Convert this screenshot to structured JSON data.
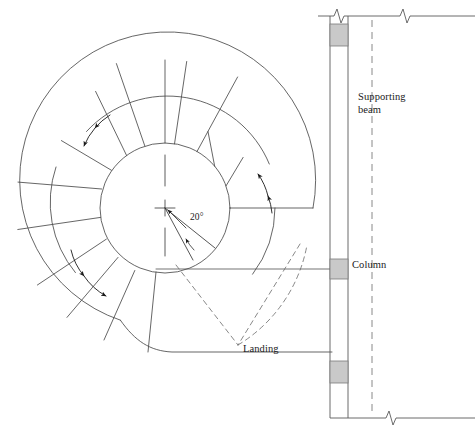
{
  "drawing": {
    "title": "Spiral staircase plan",
    "type": "architectural-plan",
    "canvas": {
      "width": 475,
      "height": 436
    },
    "colors": {
      "line": "#4a4a4a",
      "line_dark": "#2b2b2b",
      "column_fill": "#c9c9c9",
      "column_stroke": "#7a7a7a",
      "text": "#1a1a1a",
      "background": "#ffffff"
    },
    "geometry": {
      "center": {
        "x": 165,
        "y": 208
      },
      "inner_radius": 65,
      "outer_radius": 148,
      "mid_radius": 110,
      "tread_angle_deg": 20,
      "tread_count": 16
    },
    "labels": {
      "supporting_beam": "Supporting\nbeam",
      "column": "Column",
      "landing": "Landing",
      "angle": "20°"
    },
    "beam": {
      "left_x": 330,
      "right_x": 348,
      "top_y": 22,
      "bottom_y": 410,
      "centerline_x": 372,
      "columns": [
        {
          "name": "column-top",
          "y": 24,
          "height": 22
        },
        {
          "name": "column-middle",
          "y": 259,
          "height": 20
        },
        {
          "name": "column-bottom",
          "y": 361,
          "height": 22
        }
      ]
    },
    "wall_lines": {
      "top_y": 16,
      "bottom_y": 418,
      "right_x": 475,
      "break_symbols_top": 2,
      "break_symbols_bottom": 1
    },
    "direction_arrows": [
      {
        "name": "arrow-upper-left",
        "count": 2
      },
      {
        "name": "arrow-right",
        "count": 2
      },
      {
        "name": "arrow-lower-left",
        "count": 2
      }
    ]
  }
}
